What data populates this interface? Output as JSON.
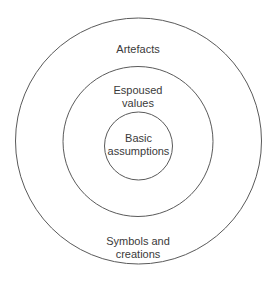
{
  "diagram": {
    "type": "concentric-circles",
    "layers": [
      {
        "id": "outer",
        "label_top": "Artefacts",
        "label_bottom_line1": "Symbols and",
        "label_bottom_line2": "creations"
      },
      {
        "id": "middle",
        "label_line1": "Espoused",
        "label_line2": "values"
      },
      {
        "id": "inner",
        "label_line1": "Basic",
        "label_line2": "assumptions"
      }
    ],
    "stroke_color": "#5a5a5a",
    "text_color": "#3a3a3a",
    "background": "#ffffff"
  }
}
